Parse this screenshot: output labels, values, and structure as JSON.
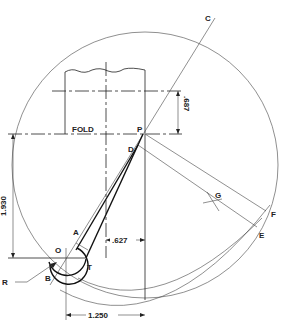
{
  "diagram": {
    "type": "technical geometric construction drawing",
    "points": {
      "C": "C",
      "P": "P",
      "D": "D",
      "G": "G",
      "F": "F",
      "E": "E",
      "A": "A",
      "O": "O",
      "T": "T",
      "B": "B",
      "R": "R"
    },
    "labels": {
      "fold": "FOLD"
    },
    "dimensions": {
      "d687": ".687",
      "d1930": "1.930",
      "d627": ".627",
      "d1250": "1.250"
    }
  }
}
